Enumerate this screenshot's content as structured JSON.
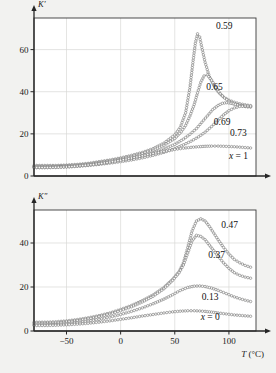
{
  "figure": {
    "background_color": "#f2f2f0",
    "frame_color": "#3a3a3a",
    "grid_color": "#d8d8d6",
    "curve_color": "#6e6e6e",
    "marker_fill": "#fbfbfa",
    "axis_color": "#262626"
  },
  "chart_data": [
    {
      "type": "line",
      "panel": "top",
      "title": "",
      "xlabel": "T (°C)",
      "ylabel": "K′",
      "xlim": [
        -80,
        125
      ],
      "ylim": [
        0,
        75
      ],
      "xticks": [
        -50,
        0,
        50,
        100
      ],
      "xticklabels": [
        "−50",
        "0",
        "50",
        "100"
      ],
      "yticks": [
        0,
        20,
        40,
        60
      ],
      "yticklabels": [
        "0",
        "20",
        "40",
        "60"
      ],
      "grid": true,
      "legend_position": "inline-annotations",
      "marker": "open-circle",
      "series": [
        {
          "name": "0.59",
          "label": "0.59",
          "label_x": 88,
          "label_y": 70,
          "x": [
            -80,
            -70,
            -60,
            -50,
            -40,
            -30,
            -20,
            -10,
            0,
            10,
            20,
            30,
            40,
            50,
            55,
            60,
            64,
            67,
            69,
            71,
            73,
            75,
            78,
            82,
            86,
            90,
            95,
            100,
            105,
            110,
            115,
            120
          ],
          "y": [
            5.0,
            5.0,
            5.0,
            5.2,
            5.5,
            6.0,
            6.8,
            7.6,
            8.6,
            9.8,
            11.2,
            13.0,
            15.6,
            19.5,
            23.0,
            30.0,
            42.0,
            55.0,
            63.0,
            67.5,
            66.0,
            61.0,
            54.0,
            47.0,
            43.0,
            40.0,
            37.5,
            36.0,
            35.0,
            34.3,
            33.8,
            33.4
          ]
        },
        {
          "name": "0.65",
          "label": "0.65",
          "label_x": 79,
          "label_y": 41,
          "x": [
            -80,
            -70,
            -60,
            -50,
            -40,
            -30,
            -20,
            -10,
            0,
            10,
            20,
            30,
            40,
            50,
            56,
            60,
            64,
            68,
            71,
            74,
            77,
            80,
            84,
            88,
            92,
            96,
            100,
            105,
            110,
            115,
            120
          ],
          "y": [
            4.6,
            4.6,
            4.7,
            4.9,
            5.2,
            5.7,
            6.4,
            7.2,
            8.1,
            9.2,
            10.6,
            12.3,
            14.6,
            17.8,
            21.0,
            24.0,
            28.5,
            34.0,
            39.5,
            44.5,
            47.5,
            48.0,
            45.5,
            42.0,
            39.0,
            37.0,
            35.5,
            34.2,
            33.5,
            33.0,
            32.8
          ]
        },
        {
          "name": "0.69",
          "label": "0.69",
          "label_x": 86,
          "label_y": 24,
          "x": [
            -80,
            -70,
            -60,
            -50,
            -40,
            -30,
            -20,
            -10,
            0,
            10,
            20,
            30,
            40,
            50,
            58,
            64,
            70,
            75,
            80,
            85,
            90,
            94,
            98,
            102,
            106,
            110,
            115,
            120
          ],
          "y": [
            4.3,
            4.3,
            4.4,
            4.6,
            4.9,
            5.3,
            5.9,
            6.6,
            7.4,
            8.4,
            9.6,
            11.0,
            12.8,
            15.0,
            17.5,
            19.8,
            22.5,
            25.5,
            28.5,
            31.5,
            33.5,
            34.5,
            34.8,
            34.5,
            34.0,
            33.5,
            33.0,
            32.8
          ]
        },
        {
          "name": "0.73",
          "label": "0.73",
          "label_x": 101,
          "label_y": 19,
          "x": [
            -80,
            -70,
            -60,
            -50,
            -40,
            -30,
            -20,
            -10,
            0,
            10,
            20,
            30,
            40,
            50,
            58,
            65,
            72,
            78,
            84,
            90,
            95,
            100,
            105,
            110,
            115,
            120
          ],
          "y": [
            4.0,
            4.0,
            4.1,
            4.3,
            4.6,
            5.0,
            5.5,
            6.1,
            6.8,
            7.6,
            8.6,
            9.8,
            11.2,
            13.0,
            14.8,
            16.5,
            18.6,
            20.8,
            23.5,
            26.5,
            29.0,
            31.0,
            32.3,
            33.0,
            33.2,
            33.2
          ]
        },
        {
          "name": "x = 1",
          "label": "x = 1",
          "label_x": 100,
          "label_y": 8,
          "x": [
            -80,
            -70,
            -60,
            -50,
            -40,
            -30,
            -20,
            -10,
            0,
            10,
            20,
            30,
            40,
            50,
            58,
            65,
            72,
            78,
            84,
            90,
            95,
            100,
            105,
            110,
            115,
            120
          ],
          "y": [
            4.0,
            4.0,
            4.1,
            4.3,
            4.7,
            5.2,
            5.8,
            6.6,
            7.5,
            8.5,
            9.6,
            10.7,
            11.7,
            12.6,
            13.2,
            13.6,
            13.9,
            14.1,
            14.2,
            14.2,
            14.1,
            14.0,
            13.9,
            13.7,
            13.5,
            13.3
          ]
        }
      ]
    },
    {
      "type": "line",
      "panel": "bottom",
      "title": "",
      "xlabel": "T (°C)",
      "ylabel": "K″",
      "xlim": [
        -80,
        125
      ],
      "ylim": [
        0,
        55
      ],
      "xticks": [
        -50,
        0,
        50,
        100
      ],
      "xticklabels": [
        "−50",
        "0",
        "50",
        "100"
      ],
      "yticks": [
        0,
        20,
        40
      ],
      "yticklabels": [
        "0",
        "20",
        "40"
      ],
      "grid": true,
      "legend_position": "inline-annotations",
      "marker": "open-circle",
      "series": [
        {
          "name": "0.47",
          "label": "0.47",
          "label_x": 93,
          "label_y": 47,
          "x": [
            -80,
            -70,
            -60,
            -50,
            -40,
            -30,
            -20,
            -10,
            0,
            10,
            20,
            30,
            40,
            48,
            54,
            58,
            62,
            66,
            70,
            74,
            78,
            82,
            86,
            90,
            95,
            100,
            105,
            110,
            115,
            120
          ],
          "y": [
            4.0,
            4.0,
            4.2,
            4.6,
            5.2,
            6.0,
            7.0,
            8.2,
            9.8,
            11.6,
            13.8,
            16.4,
            19.8,
            23.5,
            27.0,
            31.0,
            38.0,
            45.5,
            50.0,
            51.0,
            50.0,
            47.5,
            44.5,
            41.5,
            38.0,
            35.0,
            32.5,
            31.0,
            29.8,
            29.0
          ]
        },
        {
          "name": "0.37",
          "label": "0.37",
          "label_x": 81,
          "label_y": 33,
          "x": [
            -80,
            -70,
            -60,
            -50,
            -40,
            -30,
            -20,
            -10,
            0,
            10,
            20,
            30,
            40,
            48,
            54,
            58,
            62,
            66,
            70,
            74,
            78,
            82,
            86,
            90,
            95,
            100,
            105,
            110,
            115,
            120
          ],
          "y": [
            3.5,
            3.5,
            3.7,
            4.1,
            4.7,
            5.5,
            6.5,
            7.7,
            9.2,
            11.0,
            13.2,
            15.8,
            19.2,
            23.0,
            26.5,
            30.0,
            35.5,
            41.0,
            43.5,
            43.0,
            41.5,
            39.0,
            36.5,
            34.0,
            31.0,
            28.5,
            26.5,
            25.3,
            24.5,
            24.0
          ]
        },
        {
          "name": "0.13",
          "label": "0.13",
          "label_x": 75,
          "label_y": 14,
          "x": [
            -80,
            -70,
            -60,
            -50,
            -40,
            -30,
            -20,
            -10,
            0,
            10,
            20,
            30,
            40,
            48,
            55,
            62,
            68,
            73,
            78,
            84,
            90,
            95,
            100,
            105,
            110,
            115,
            120
          ],
          "y": [
            2.8,
            2.8,
            3.0,
            3.3,
            3.8,
            4.5,
            5.3,
            6.3,
            7.5,
            8.9,
            10.5,
            12.4,
            14.5,
            16.5,
            18.4,
            19.8,
            20.4,
            20.5,
            20.2,
            19.5,
            18.5,
            17.5,
            16.5,
            15.5,
            14.7,
            14.0,
            13.4
          ]
        },
        {
          "name": "x = 0",
          "label": "x = 0",
          "label_x": 74,
          "label_y": 5,
          "x": [
            -80,
            -70,
            -60,
            -50,
            -40,
            -30,
            -20,
            -10,
            0,
            10,
            20,
            30,
            40,
            48,
            55,
            62,
            68,
            73,
            78,
            84,
            90,
            95,
            100,
            105,
            110,
            115,
            120
          ],
          "y": [
            2.5,
            2.5,
            2.6,
            2.8,
            3.1,
            3.5,
            4.0,
            4.6,
            5.3,
            6.0,
            6.8,
            7.5,
            8.2,
            8.7,
            9.0,
            9.2,
            9.2,
            9.1,
            8.9,
            8.6,
            8.2,
            7.9,
            7.6,
            7.3,
            7.1,
            6.9,
            6.7
          ]
        }
      ]
    }
  ]
}
